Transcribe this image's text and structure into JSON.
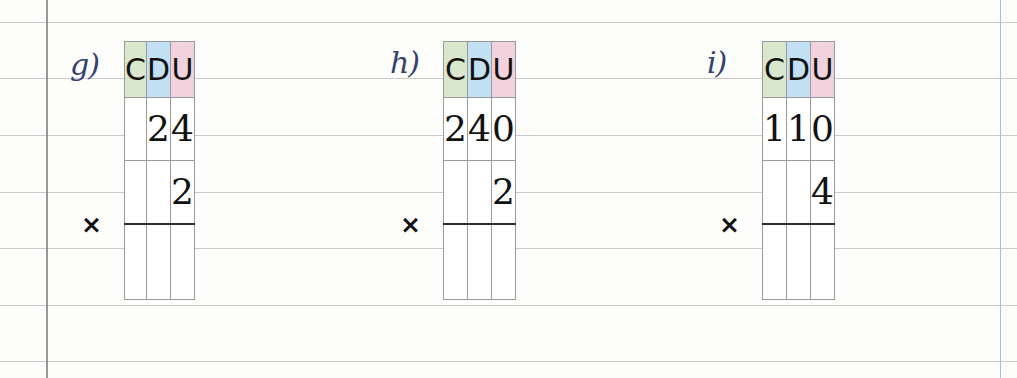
{
  "page": {
    "background": "#fdfdfc",
    "rule_color": "#bfbfbf",
    "margin_line_color": "#8e8e8e",
    "blue_line_color": "#9fc2e0",
    "ink_color": "#33416e"
  },
  "colors": {
    "header_hundreds": "#d9e8cd",
    "header_tens": "#c2e1f4",
    "header_units": "#f2d2dd",
    "grid_line": "#9a9a9a",
    "answer_rule": "#2f2f2f"
  },
  "headers": {
    "hundreds": "C",
    "tens": "D",
    "units": "U"
  },
  "operator": "×",
  "exercises": [
    {
      "label": "g)",
      "multiplicand": {
        "hundreds": "",
        "tens": "2",
        "units": "4"
      },
      "multiplier": {
        "hundreds": "",
        "tens": "",
        "units": "2"
      },
      "answer": {
        "hundreds": "",
        "tens": "",
        "units": ""
      }
    },
    {
      "label": "h)",
      "multiplicand": {
        "hundreds": "2",
        "tens": "4",
        "units": "0"
      },
      "multiplier": {
        "hundreds": "",
        "tens": "",
        "units": "2"
      },
      "answer": {
        "hundreds": "",
        "tens": "",
        "units": ""
      }
    },
    {
      "label": "i)",
      "multiplicand": {
        "hundreds": "1",
        "tens": "1",
        "units": "0"
      },
      "multiplier": {
        "hundreds": "",
        "tens": "",
        "units": "4"
      },
      "answer": {
        "hundreds": "",
        "tens": "",
        "units": ""
      }
    }
  ]
}
